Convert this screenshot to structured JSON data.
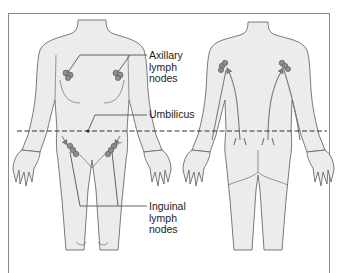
{
  "diagram": {
    "title": "",
    "views": [
      "front",
      "back"
    ],
    "labels": {
      "axillary": [
        "Axillary",
        "lymph",
        "nodes"
      ],
      "umbilicus": "Umbilicus",
      "inguinal": [
        "Inguinal",
        "lymph",
        "nodes"
      ]
    },
    "umbilical_line": {
      "style": "dashed",
      "y": 131
    },
    "colors": {
      "skin": "#ececec",
      "outline": "#6b6b6b",
      "node": "#8c8c8c",
      "arrow": "#7a7a7a",
      "frame": "#8a8a8a",
      "text": "#222222"
    }
  }
}
